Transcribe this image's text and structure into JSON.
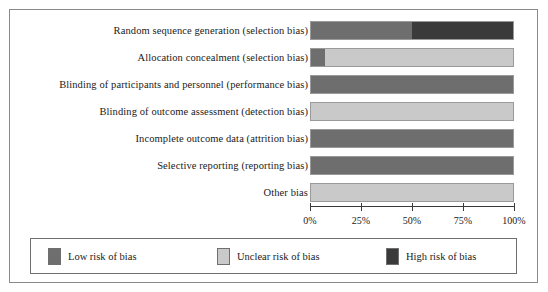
{
  "figure": {
    "title": "",
    "colors": {
      "low": "#6e6e6e",
      "unclear": "#c9c9c9",
      "high": "#3a3a3a",
      "frame": "#8a8a8a",
      "axis": "#3a3a3a"
    }
  },
  "chart_data": {
    "type": "bar",
    "title": "",
    "xlabel": "",
    "ylabel": "",
    "xlim": [
      0,
      100
    ],
    "grid": false,
    "orientation": "horizontal",
    "stacked": true,
    "legend_position": "bottom",
    "tick_labels": [
      "0%",
      "25%",
      "50%",
      "75%",
      "100%"
    ],
    "ticks": [
      0,
      25,
      50,
      75,
      100
    ],
    "categories": [
      "Random sequence generation (selection bias)",
      "Allocation concealment (selection bias)",
      "Blinding of participants and personnel (performance bias)",
      "Blinding of outcome assessment (detection bias)",
      "Incomplete outcome data (attrition bias)",
      "Selective reporting (reporting bias)",
      "Other bias"
    ],
    "series": [
      {
        "name": "Low risk of bias",
        "color": "#6e6e6e",
        "values": [
          50,
          7,
          100,
          0,
          100,
          100,
          0
        ]
      },
      {
        "name": "Unclear risk of bias",
        "color": "#c9c9c9",
        "values": [
          0,
          93,
          0,
          100,
          0,
          0,
          100
        ]
      },
      {
        "name": "High risk of bias",
        "color": "#3a3a3a",
        "values": [
          50,
          0,
          0,
          0,
          0,
          0,
          0
        ]
      }
    ]
  },
  "legend": {
    "items": [
      {
        "label": "Low risk of bias",
        "color": "#6e6e6e"
      },
      {
        "label": "Unclear risk of bias",
        "color": "#c9c9c9"
      },
      {
        "label": "High risk of bias",
        "color": "#3a3a3a"
      }
    ]
  }
}
